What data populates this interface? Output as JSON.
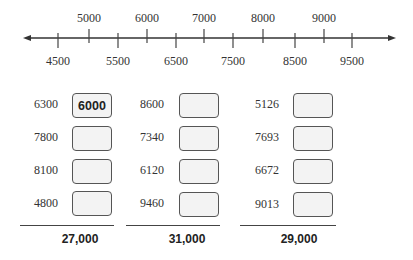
{
  "number_line": {
    "top_labels": [
      {
        "value": "5000",
        "x": 89
      },
      {
        "value": "6000",
        "x": 147
      },
      {
        "value": "7000",
        "x": 204
      },
      {
        "value": "8000",
        "x": 263
      },
      {
        "value": "9000",
        "x": 324
      }
    ],
    "bottom_labels": [
      {
        "value": "4500",
        "x": 58
      },
      {
        "value": "5500",
        "x": 118
      },
      {
        "value": "6500",
        "x": 176
      },
      {
        "value": "7500",
        "x": 233
      },
      {
        "value": "8500",
        "x": 295
      },
      {
        "value": "9500",
        "x": 352
      }
    ]
  },
  "groups": [
    {
      "numbers": [
        "6300",
        "7800",
        "8100",
        "4800"
      ],
      "answers": [
        "6000",
        "",
        "",
        ""
      ],
      "total": "27,000"
    },
    {
      "numbers": [
        "8600",
        "7340",
        "6120",
        "9460"
      ],
      "answers": [
        "",
        "",
        "",
        ""
      ],
      "total": "31,000"
    },
    {
      "numbers": [
        "5126",
        "7693",
        "6672",
        "9013"
      ],
      "answers": [
        "",
        "",
        "",
        ""
      ],
      "total": "29,000"
    }
  ]
}
